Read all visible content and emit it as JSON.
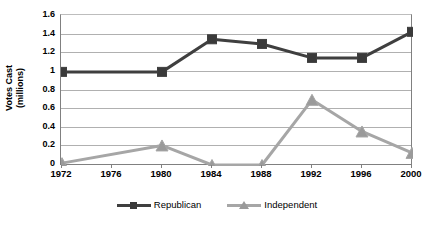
{
  "chart_data": {
    "type": "line",
    "title": "",
    "xlabel": "",
    "ylabel": "Votes Cast (millions)",
    "ylabel_line1": "Votes Cast",
    "ylabel_line2": "(millions)",
    "categories": [
      "1972",
      "1976",
      "1980",
      "1984",
      "1988",
      "1992",
      "1996",
      "2000"
    ],
    "x_tick_labels": [
      "1972",
      "1976",
      "1980",
      "1984",
      "1988",
      "1992",
      "1996",
      "2000"
    ],
    "y_tick_labels": [
      "0",
      "0.2",
      "0.4",
      "0.6",
      "0.8",
      "1",
      "1.2",
      "1.4",
      "1.6"
    ],
    "y_tick_values": [
      0,
      0.2,
      0.4,
      0.6,
      0.8,
      1,
      1.2,
      1.4,
      1.6
    ],
    "ylim": [
      0,
      1.6
    ],
    "grid": true,
    "grid_axis": "y",
    "legend_position": "bottom",
    "series": [
      {
        "name": "Republican",
        "marker": "square",
        "color": "#3f3f3f",
        "marker_color": "#3a3a3a",
        "x": [
          "1972",
          "1980",
          "1984",
          "1988",
          "1992",
          "1996",
          "2000"
        ],
        "values": [
          1.0,
          1.0,
          1.35,
          1.3,
          1.15,
          1.15,
          1.43
        ],
        "values_by_category": [
          1.0,
          null,
          1.0,
          1.35,
          1.3,
          1.15,
          1.15,
          1.43
        ]
      },
      {
        "name": "Independent",
        "marker": "triangle",
        "color": "#a6a6a6",
        "marker_color": "#9a9a9a",
        "x": [
          "1972",
          "1980",
          "1984",
          "1988",
          "1992",
          "1996",
          "2000"
        ],
        "values": [
          0.02,
          0.21,
          0.0,
          0.0,
          0.7,
          0.36,
          0.13
        ],
        "values_by_category": [
          0.02,
          null,
          0.21,
          0.0,
          0.0,
          0.7,
          0.36,
          0.13
        ]
      }
    ]
  },
  "legend": {
    "items": [
      {
        "label": "Republican"
      },
      {
        "label": "Independent"
      }
    ]
  },
  "colors": {
    "republican": "#3f3f3f",
    "independent": "#a6a6a6",
    "gridline": "#b0b0b0",
    "axis": "#808080",
    "background": "#ffffff"
  }
}
